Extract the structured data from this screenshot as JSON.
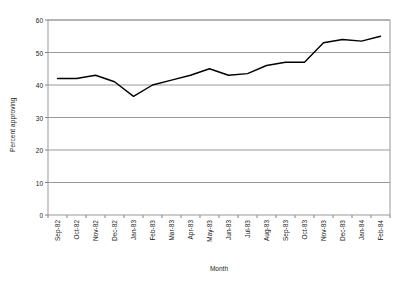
{
  "chart_data": {
    "type": "line",
    "title": "",
    "xlabel": "Month",
    "ylabel": "Percent approving",
    "ylim": [
      0,
      60
    ],
    "yticks": [
      0,
      10,
      20,
      30,
      40,
      50,
      60
    ],
    "grid": true,
    "legend": "none",
    "line_color": "#000000",
    "plot_border_color": "#808080",
    "gridline_color": "#999999",
    "categories": [
      "Sep-82",
      "Oct-82",
      "Nov-82",
      "Dec-82",
      "Jan-83",
      "Feb-83",
      "Mar-83",
      "Apr-83",
      "May-83",
      "Jun-83",
      "Jul-83",
      "Aug-83",
      "Sep-83",
      "Oct-83",
      "Nov-83",
      "Dec-83",
      "Jan-84",
      "Feb-84"
    ],
    "values": [
      42,
      42,
      43,
      41,
      36.5,
      40,
      41.5,
      43,
      45,
      43,
      43.5,
      46,
      47,
      47,
      53,
      54,
      53.5,
      55
    ],
    "series": [
      {
        "name": "Percent approving",
        "values": [
          42,
          42,
          43,
          41,
          36.5,
          40,
          41.5,
          43,
          45,
          43,
          43.5,
          46,
          47,
          47,
          53,
          54,
          53.5,
          55
        ]
      }
    ]
  }
}
